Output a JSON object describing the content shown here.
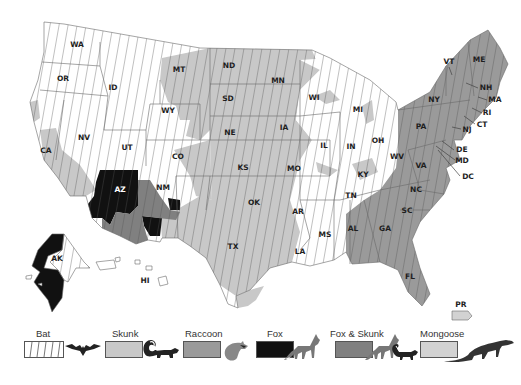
{
  "map": {
    "title": "Rabies reservoir species by region, United States",
    "colors": {
      "bat_hatch_bg": "#ffffff",
      "bat_hatch_line": "#555555",
      "skunk": "#c8c8c8",
      "raccoon": "#9a9a9a",
      "fox": "#111111",
      "fox_skunk": "#808080",
      "mongoose": "#d2d2d2",
      "border": "#6a6a6a"
    },
    "states": [
      {
        "abbr": "WA",
        "x": 77,
        "y": 45
      },
      {
        "abbr": "OR",
        "x": 63,
        "y": 79
      },
      {
        "abbr": "ID",
        "x": 113,
        "y": 88
      },
      {
        "abbr": "MT",
        "x": 179,
        "y": 70
      },
      {
        "abbr": "ND",
        "x": 229,
        "y": 66
      },
      {
        "abbr": "SD",
        "x": 228,
        "y": 99
      },
      {
        "abbr": "MN",
        "x": 278,
        "y": 81
      },
      {
        "abbr": "WI",
        "x": 314,
        "y": 98
      },
      {
        "abbr": "MI",
        "x": 358,
        "y": 110
      },
      {
        "abbr": "WY",
        "x": 168,
        "y": 111
      },
      {
        "abbr": "NE",
        "x": 230,
        "y": 133
      },
      {
        "abbr": "IA",
        "x": 284,
        "y": 128
      },
      {
        "abbr": "IL",
        "x": 324,
        "y": 146
      },
      {
        "abbr": "IN",
        "x": 351,
        "y": 147
      },
      {
        "abbr": "OH",
        "x": 378,
        "y": 141
      },
      {
        "abbr": "NV",
        "x": 84,
        "y": 138
      },
      {
        "abbr": "UT",
        "x": 127,
        "y": 148
      },
      {
        "abbr": "CO",
        "x": 178,
        "y": 157
      },
      {
        "abbr": "KS",
        "x": 243,
        "y": 168
      },
      {
        "abbr": "MO",
        "x": 294,
        "y": 169
      },
      {
        "abbr": "KY",
        "x": 363,
        "y": 175
      },
      {
        "abbr": "WV",
        "x": 397,
        "y": 157
      },
      {
        "abbr": "VA",
        "x": 421,
        "y": 166
      },
      {
        "abbr": "CA",
        "x": 46,
        "y": 151
      },
      {
        "abbr": "AZ",
        "x": 120,
        "y": 190
      },
      {
        "abbr": "NM",
        "x": 163,
        "y": 188
      },
      {
        "abbr": "OK",
        "x": 254,
        "y": 203
      },
      {
        "abbr": "AR",
        "x": 298,
        "y": 212
      },
      {
        "abbr": "TN",
        "x": 351,
        "y": 196
      },
      {
        "abbr": "NC",
        "x": 416,
        "y": 190
      },
      {
        "abbr": "SC",
        "x": 407,
        "y": 211
      },
      {
        "abbr": "MS",
        "x": 325,
        "y": 235
      },
      {
        "abbr": "AL",
        "x": 353,
        "y": 229
      },
      {
        "abbr": "GA",
        "x": 385,
        "y": 229
      },
      {
        "abbr": "TX",
        "x": 233,
        "y": 247
      },
      {
        "abbr": "LA",
        "x": 300,
        "y": 252
      },
      {
        "abbr": "FL",
        "x": 410,
        "y": 277
      },
      {
        "abbr": "AK",
        "x": 57,
        "y": 259
      },
      {
        "abbr": "HI",
        "x": 145,
        "y": 281
      },
      {
        "abbr": "PR",
        "x": 461,
        "y": 305
      },
      {
        "abbr": "VT",
        "x": 449,
        "y": 62
      },
      {
        "abbr": "ME",
        "x": 479,
        "y": 60
      },
      {
        "abbr": "NY",
        "x": 434,
        "y": 100
      },
      {
        "abbr": "PA",
        "x": 421,
        "y": 127
      },
      {
        "abbr": "NH",
        "x": 486,
        "y": 88
      },
      {
        "abbr": "MA",
        "x": 495,
        "y": 100
      },
      {
        "abbr": "RI",
        "x": 487,
        "y": 113
      },
      {
        "abbr": "CT",
        "x": 482,
        "y": 125
      },
      {
        "abbr": "NJ",
        "x": 467,
        "y": 130
      },
      {
        "abbr": "DE",
        "x": 462,
        "y": 150
      },
      {
        "abbr": "MD",
        "x": 462,
        "y": 161
      },
      {
        "abbr": "DC",
        "x": 468,
        "y": 177
      }
    ]
  },
  "legend": {
    "items": [
      {
        "label": "Bat",
        "animal": "bat-silhouette"
      },
      {
        "label": "Skunk",
        "animal": "skunk-silhouette"
      },
      {
        "label": "Raccoon",
        "animal": "raccoon-silhouette"
      },
      {
        "label": "Fox",
        "animal": "fox-silhouette"
      },
      {
        "label": "Fox & Skunk",
        "animal": "fox-and-skunk-silhouette"
      },
      {
        "label": "Mongoose",
        "animal": "mongoose-silhouette"
      }
    ]
  }
}
